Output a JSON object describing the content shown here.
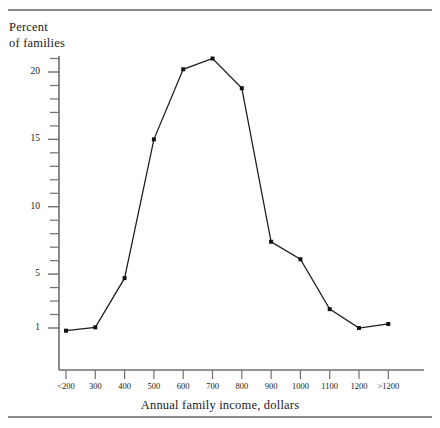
{
  "figure": {
    "y_axis_title": "Percent\nof families",
    "x_axis_title": "Annual family income, dollars",
    "line_color": "#1c1c1c",
    "marker_color": "#111111",
    "axis_color": "#6f6f6f",
    "rule_color": "#8a8a8a"
  },
  "chart_data": {
    "type": "line",
    "title": "",
    "subtitle": "",
    "xlabel": "Annual family income, dollars",
    "ylabel": "Percent of families",
    "categories": [
      "<200",
      "300",
      "400",
      "500",
      "600",
      "700",
      "800",
      "900",
      "1000",
      "1100",
      "1200",
      ">1200"
    ],
    "values": [
      0.8,
      1.05,
      4.7,
      15.0,
      20.2,
      21.0,
      18.8,
      7.4,
      6.1,
      2.4,
      1.0,
      1.3
    ],
    "series": [
      {
        "name": "Percent of families",
        "values": [
          0.8,
          1.05,
          4.7,
          15.0,
          20.2,
          21.0,
          18.8,
          7.4,
          6.1,
          2.4,
          1.0,
          1.3
        ]
      }
    ],
    "ylim": [
      0.0,
      22.3
    ],
    "xlim": [
      0,
      11
    ],
    "y_ticks_major": [
      1,
      5,
      10,
      15,
      20
    ],
    "y_tick_labels": [
      "1",
      "5",
      "10",
      "15",
      "20"
    ],
    "y_ticks_minor": [
      2,
      3,
      4,
      6,
      7,
      8,
      9,
      11,
      12,
      13,
      14,
      16,
      17,
      18,
      19,
      21,
      22
    ],
    "x_tick_labels": [
      "<200",
      "300",
      "400",
      "500",
      "600",
      "700",
      "800",
      "900",
      "1000",
      "1100",
      "1200",
      ">1200"
    ],
    "grid": "off",
    "legend": "none",
    "markers": "filled-square",
    "annotations": []
  }
}
